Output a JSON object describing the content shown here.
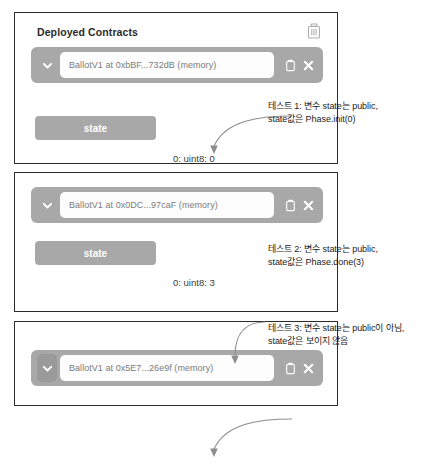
{
  "panels": [
    {
      "title": "Deployed Contracts",
      "trash_icon": "trash-icon",
      "contract": {
        "chevron_icon": "chevron-down-icon",
        "address": "BallotV1 at 0xbBF...732dB (memory)",
        "copy_icon": "copy-icon",
        "close_icon": "close-icon"
      },
      "state_button": "state",
      "result": "0: uint8: 0",
      "annotation": "테스트 1: 변수 state는 public,\nstate값은 Phase.init(0)"
    },
    {
      "contract": {
        "chevron_icon": "chevron-down-icon",
        "address": "BallotV1 at 0x0DC...97caF (memory)",
        "copy_icon": "copy-icon",
        "close_icon": "close-icon"
      },
      "state_button": "state",
      "result": "0: uint8: 3",
      "annotation": "테스트 2: 변수 state는 public,\nstate값은 Phase.done(3)"
    },
    {
      "contract": {
        "chevron_icon": "chevron-down-icon",
        "address": "BallotV1 at 0x5E7...26e9f (memory)",
        "copy_icon": "copy-icon",
        "close_icon": "close-icon"
      },
      "annotation": "테스트 3: 변수 state는 public이 아님,\nstate값은 보이지 않음"
    }
  ],
  "colors": {
    "bar_gray": "#a8a8a8",
    "panel_border": "#2a2a2a",
    "field_white": "#fdfdfd",
    "text_dark": "#222222",
    "addr_text": "#7c7c7c"
  }
}
